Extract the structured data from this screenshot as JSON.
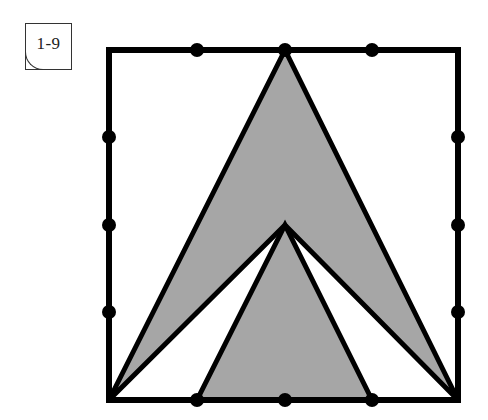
{
  "label": {
    "text": "1-9"
  },
  "figure": {
    "square": {
      "x1": 109,
      "y1": 50,
      "x2": 458,
      "y2": 400,
      "stroke": "#000000",
      "stroke_width": 6
    },
    "fill_color": "#a6a6a6",
    "outer_chevron_points": [
      [
        285,
        50
      ],
      [
        458,
        400
      ],
      [
        285,
        225
      ],
      [
        109,
        400
      ]
    ],
    "inner_triangle_points": [
      [
        285,
        225
      ],
      [
        197,
        400
      ],
      [
        372,
        400
      ]
    ],
    "dots": [
      [
        197,
        50
      ],
      [
        285,
        50
      ],
      [
        372,
        50
      ],
      [
        109,
        137
      ],
      [
        109,
        225
      ],
      [
        109,
        312
      ],
      [
        458,
        137
      ],
      [
        458,
        225
      ],
      [
        458,
        312
      ],
      [
        197,
        400
      ],
      [
        285,
        400
      ],
      [
        372,
        400
      ]
    ],
    "dot_radius": 7,
    "dot_color": "#000000"
  }
}
